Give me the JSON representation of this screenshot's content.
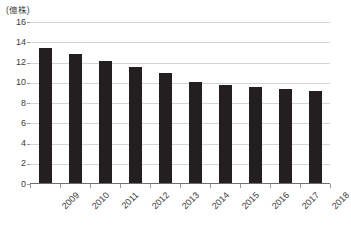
{
  "chart_data": {
    "type": "bar",
    "title": "",
    "subtitle": "",
    "unit_label": "(億株)",
    "xlabel": "",
    "ylabel": "",
    "ylim": [
      0,
      16
    ],
    "ytick_step": 2,
    "grid": true,
    "legend": "none",
    "bar_color": "#231f20",
    "grid_color": "#d4d4d4",
    "axis_color": "#6e6e6e",
    "text_color": "#3b3b3b",
    "categories": [
      "2009",
      "2010",
      "2011",
      "2012",
      "2013",
      "2014",
      "2015",
      "2016",
      "2017",
      "2018"
    ],
    "values": [
      13.4,
      12.8,
      12.1,
      11.6,
      11.0,
      10.1,
      9.8,
      9.6,
      9.4,
      9.2
    ],
    "ytick_labels": [
      "16",
      "14",
      "12",
      "10",
      "8",
      "6",
      "4",
      "2",
      "0"
    ],
    "ytick_values": [
      16,
      14,
      12,
      10,
      8,
      6,
      4,
      2,
      0
    ]
  }
}
